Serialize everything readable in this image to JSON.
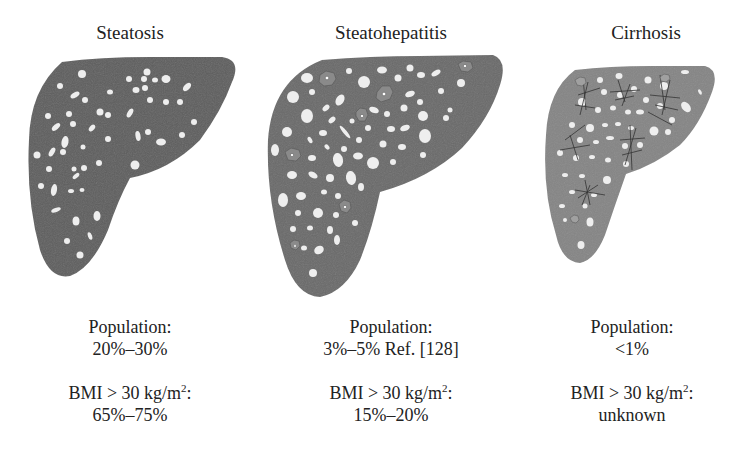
{
  "stages": [
    {
      "title": "Steatosis",
      "population_label": "Population:",
      "population_value": "20%–30%",
      "bmi_label": "BMI > 30 kg/m",
      "bmi_sup": "2",
      "bmi_colon": ":",
      "bmi_value": "65%–75%"
    },
    {
      "title": "Steatohepatitis",
      "population_label": "Population:",
      "population_value": "3%–5% Ref. [128]",
      "bmi_label": "BMI > 30 kg/m",
      "bmi_sup": "2",
      "bmi_colon": ":",
      "bmi_value": "15%–20%"
    },
    {
      "title": "Cirrhosis",
      "population_label": "Population:",
      "population_value": "<1%",
      "bmi_label": "BMI > 30 kg/m",
      "bmi_sup": "2",
      "bmi_colon": ":",
      "bmi_value": "unknown"
    }
  ],
  "colors": {
    "steatosis_fill": "#5f5f5f",
    "steatohepatitis_fill": "#6a6a6a",
    "cirrhosis_fill": "#858585",
    "fat_droplet": "#eeeeee",
    "fibrosis_lines": "#333333"
  }
}
